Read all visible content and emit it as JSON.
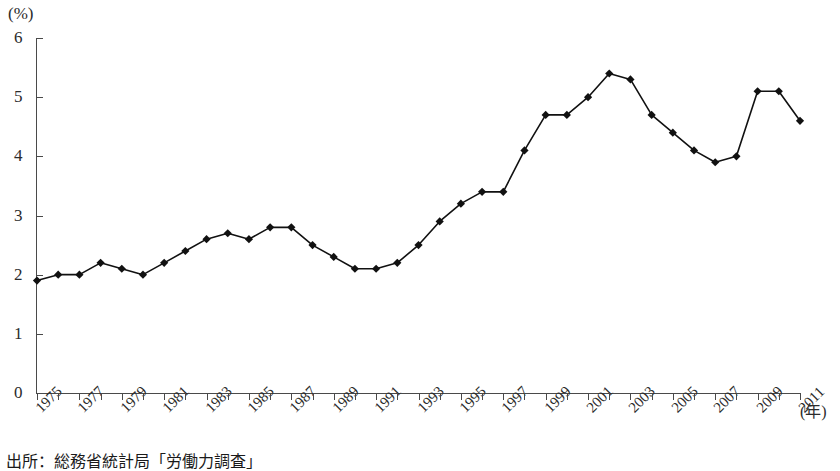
{
  "chart_data": {
    "type": "line",
    "title": "",
    "subtitle": "",
    "xlabel": "(年)",
    "ylabel": "(%)",
    "y_unit_label": "(%)",
    "x_unit_label": "(年)",
    "xlim": [
      1975,
      2011
    ],
    "ylim": [
      0,
      6
    ],
    "grid": false,
    "legend": "none",
    "y_ticks": [
      0,
      1,
      2,
      3,
      4,
      5,
      6
    ],
    "y_tick_labels": [
      "0",
      "1",
      "2",
      "3",
      "4",
      "5",
      "6"
    ],
    "x_tick_labels": [
      "1975",
      "1977",
      "1979",
      "1981",
      "1983",
      "1985",
      "1987",
      "1989",
      "1991",
      "1993",
      "1995",
      "1997",
      "1999",
      "2001",
      "2003",
      "2005",
      "2007",
      "2009",
      "2011"
    ],
    "x": [
      1975,
      1976,
      1977,
      1978,
      1979,
      1980,
      1981,
      1982,
      1983,
      1984,
      1985,
      1986,
      1987,
      1988,
      1989,
      1990,
      1991,
      1992,
      1993,
      1994,
      1995,
      1996,
      1997,
      1998,
      1999,
      2000,
      2001,
      2002,
      2003,
      2004,
      2005,
      2006,
      2007,
      2008,
      2009,
      2010,
      2011
    ],
    "values": [
      1.9,
      2.0,
      2.0,
      2.2,
      2.1,
      2.0,
      2.2,
      2.4,
      2.6,
      2.7,
      2.6,
      2.8,
      2.8,
      2.5,
      2.3,
      2.1,
      2.1,
      2.2,
      2.5,
      2.9,
      3.2,
      3.4,
      3.4,
      4.1,
      4.7,
      4.7,
      5.0,
      5.4,
      5.3,
      4.7,
      4.4,
      4.1,
      3.9,
      4.0,
      5.1,
      5.1,
      4.6
    ],
    "series": [
      {
        "name": "完全失業率",
        "marker": "diamond",
        "color": "#111111",
        "values": [
          1.9,
          2.0,
          2.0,
          2.2,
          2.1,
          2.0,
          2.2,
          2.4,
          2.6,
          2.7,
          2.6,
          2.8,
          2.8,
          2.5,
          2.3,
          2.1,
          2.1,
          2.2,
          2.5,
          2.9,
          3.2,
          3.4,
          3.4,
          4.1,
          4.7,
          4.7,
          5.0,
          5.4,
          5.3,
          4.7,
          4.4,
          4.1,
          3.9,
          4.0,
          5.1,
          5.1,
          4.6
        ]
      }
    ]
  },
  "footer": {
    "source_note": "出所：総務省統計局「労働力調査」"
  },
  "colors": {
    "line": "#111111",
    "marker": "#111111",
    "axis": "#4a4a4a",
    "text": "#2b2b2b",
    "background": "#ffffff"
  }
}
